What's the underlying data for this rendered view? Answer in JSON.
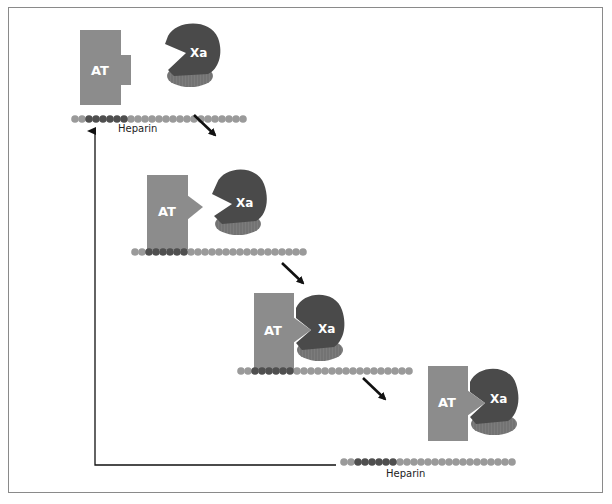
{
  "figure": {
    "colors": {
      "frame": "#8a8a8a",
      "antithrombin": "#8c8c8c",
      "xa_body": "#4a4a4a",
      "xa_base": "#7a7a7a",
      "heparin_light": "#9a9a9a",
      "heparin_dark": "#4f4f4f",
      "arrow": "#111111"
    },
    "labels": {
      "antithrombin": "AT",
      "factor_xa": "Xa",
      "heparin": "Heparin"
    },
    "stages": [
      {
        "id": 1,
        "description": "AT and Xa free, AT near heparin"
      },
      {
        "id": 2,
        "description": "AT bound to heparin, conformational change (pointed reactive loop)"
      },
      {
        "id": 3,
        "description": "AT-Xa complex forming on heparin"
      },
      {
        "id": 4,
        "description": "AT-Xa complex released; heparin recycled"
      }
    ],
    "heparin_chain": {
      "bead_count": 20,
      "dark_bead_indices": [
        2,
        3,
        4,
        5,
        6
      ]
    },
    "feedback_arrow": "Heparin released and reused (arrow back to stage 1)"
  }
}
